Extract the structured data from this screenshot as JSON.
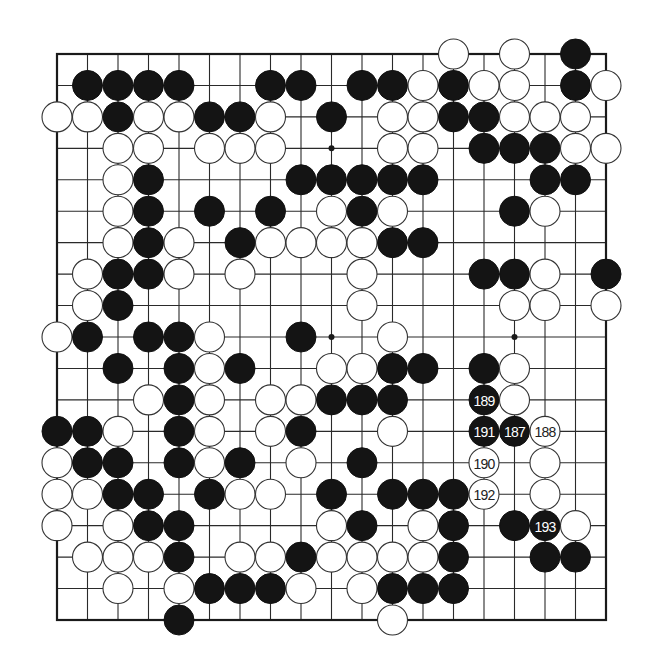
{
  "board": {
    "size": 19,
    "geometry": {
      "left": 57,
      "top": 54,
      "right": 606,
      "bottom": 620,
      "stone_radius": 15
    },
    "colors": {
      "black": "#141414",
      "white": "#ffffff",
      "line": "#2a2a2a"
    },
    "star_points": [
      [
        9,
        3
      ],
      [
        9,
        9
      ],
      [
        15,
        9
      ]
    ],
    "rows": [
      ".............W.W.B.",
      ".BBBB..BB.BBWBWW.BW",
      "WWBWWBBW.B.WWBBWWW.",
      "..WW.WWW...WW.BBBWW",
      "..WB....BBBBB...BB.",
      "..WB.B.B.WBW...BW..",
      "..WBW.BWWWWBB......",
      ".WBBW.W...W...BBW.B",
      ".WB.......W....WW.W",
      "WB.BBW..B..W.......",
      "..B.BWB..WWBB.BW...",
      "...WBW.WWBBB..BW...",
      "BBW.BW.WB..W..BBW..",
      "WBB.BWB.W.B...W.W..",
      "WWBB.BWW.B.BBBW.W..",
      "W.WBB....WB.WB.BBW.",
      ".WWWB.WWBWWWWB..BB.",
      "..W.WBBBW.WBBB.....",
      "....B......W......."
    ],
    "numbered_stones": [
      {
        "number": "187",
        "color": "B",
        "col": 15,
        "row": 12
      },
      {
        "number": "188",
        "color": "W",
        "col": 16,
        "row": 12
      },
      {
        "number": "189",
        "color": "B",
        "col": 14,
        "row": 11
      },
      {
        "number": "190",
        "color": "W",
        "col": 14,
        "row": 13
      },
      {
        "number": "191",
        "color": "B",
        "col": 14,
        "row": 12
      },
      {
        "number": "192",
        "color": "W",
        "col": 14,
        "row": 14
      },
      {
        "number": "193",
        "color": "B",
        "col": 16,
        "row": 15
      }
    ]
  }
}
